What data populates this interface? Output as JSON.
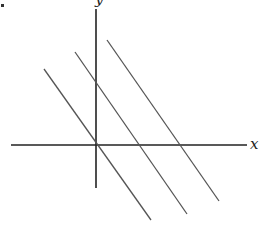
{
  "diagram": {
    "title": "",
    "axes": {
      "x_label": "x",
      "y_label": "y",
      "origin": [
        96,
        145
      ],
      "x_axis": {
        "from": [
          11,
          145
        ],
        "to": [
          247,
          145
        ]
      },
      "y_axis": {
        "from": [
          96,
          9
        ],
        "to": [
          96,
          188
        ]
      },
      "color": "#222222"
    },
    "lines": [
      {
        "name": "line-1",
        "from": [
          44,
          69
        ],
        "to": [
          151,
          220
        ],
        "color": "#555555"
      },
      {
        "name": "line-2",
        "from": [
          75,
          52
        ],
        "to": [
          187,
          214
        ],
        "color": "#555555"
      },
      {
        "name": "line-3",
        "from": [
          107,
          40
        ],
        "to": [
          219,
          201
        ],
        "color": "#555555"
      }
    ]
  }
}
